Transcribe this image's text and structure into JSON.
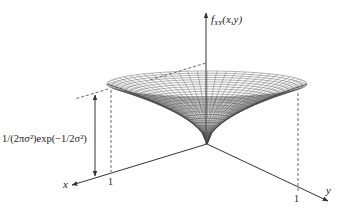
{
  "figure": {
    "type": "3d-surface-plot",
    "colors": {
      "background": "#ffffff",
      "axis": "#333333",
      "mesh": "#555555",
      "dashed": "#444444",
      "text": "#222222"
    }
  },
  "axes": {
    "z_label_main": "f",
    "z_label_sub": "XY",
    "z_label_args": "(x,y)",
    "x_label": "x",
    "y_label": "y",
    "x_tick": "1",
    "y_tick": "1"
  },
  "annotation": {
    "height_label": "1/(2πσ²)exp(−1/2σ²)"
  }
}
